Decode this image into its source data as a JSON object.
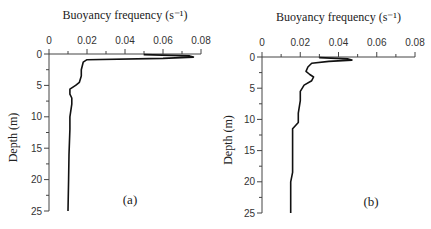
{
  "chart_data": [
    {
      "type": "line",
      "panel_label": "(a)",
      "title": "Buoyancy frequency (s⁻¹)",
      "xlabel": "Buoyancy frequency (s⁻¹)",
      "ylabel": "Depth (m)",
      "xlim": [
        0,
        0.08
      ],
      "ylim": [
        25,
        0
      ],
      "x_ticks": [
        "0",
        "0.02",
        "0.04",
        "0.06",
        "0.08"
      ],
      "y_ticks": [
        "0",
        "5",
        "10",
        "15",
        "20",
        "25"
      ],
      "x_axis_position": "top",
      "y_inverted": true,
      "grid": false,
      "series": [
        {
          "name": "N profile (a)",
          "x": [
            0.05,
            0.074,
            0.076,
            0.06,
            0.02,
            0.018,
            0.017,
            0.017,
            0.016,
            0.014,
            0.011,
            0.011,
            0.012,
            0.012,
            0.011,
            0.011,
            0.0105,
            0.0103,
            0.01
          ],
          "y": [
            0.1,
            0.3,
            0.5,
            0.7,
            0.9,
            1.3,
            2.5,
            3.5,
            4.5,
            5.0,
            5.6,
            6.4,
            7.0,
            8.0,
            10.0,
            12.0,
            16.0,
            20.0,
            25.0
          ]
        }
      ]
    },
    {
      "type": "line",
      "panel_label": "(b)",
      "title": "Buoyancy frequency (s⁻¹)",
      "xlabel": "Buoyancy frequency (s⁻¹)",
      "ylabel": "Depth (m)",
      "xlim": [
        0,
        0.08
      ],
      "ylim": [
        25,
        0
      ],
      "x_ticks": [
        "0",
        "0.02",
        "0.04",
        "0.06",
        "0.08"
      ],
      "y_ticks": [
        "0",
        "5",
        "10",
        "15",
        "20",
        "25"
      ],
      "x_axis_position": "top",
      "y_inverted": true,
      "grid": false,
      "series": [
        {
          "name": "N profile (b)",
          "x": [
            0.03,
            0.045,
            0.047,
            0.035,
            0.026,
            0.024,
            0.023,
            0.025,
            0.027,
            0.026,
            0.022,
            0.02,
            0.02,
            0.019,
            0.019,
            0.016,
            0.016,
            0.016,
            0.015,
            0.015,
            0.015
          ],
          "y": [
            0.1,
            0.3,
            0.5,
            0.7,
            1.0,
            1.6,
            2.3,
            2.8,
            3.2,
            3.8,
            4.5,
            5.5,
            7.0,
            9.0,
            10.5,
            11.5,
            14.0,
            18.5,
            20.0,
            22.0,
            25.0
          ]
        }
      ]
    }
  ]
}
